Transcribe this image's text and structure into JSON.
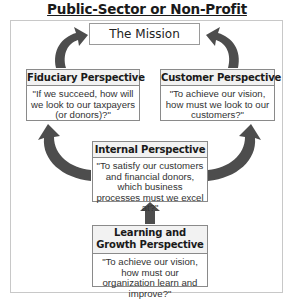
{
  "title": "Public-Sector or Non-Profit",
  "mission": {
    "label": "The Mission"
  },
  "boxes": {
    "fiduciary": {
      "header": "Fiduciary Perspective",
      "question": "\"If we succeed, how will we look to our taxpayers (or donors)?\""
    },
    "customer": {
      "header": "Customer Perspective",
      "question": "\"To achieve our vision, how must we look to our customers?\""
    },
    "internal": {
      "header": "Internal Perspective",
      "question": "\"To satisfy our customers and financial donors, which business processes must we excel at?\""
    },
    "learning": {
      "header": "Learning and Growth Perspective",
      "question": "\"To achieve our vision, how must our organization learn and improve?\""
    }
  },
  "arrows": [
    {
      "from": "fiduciary",
      "to": "mission"
    },
    {
      "from": "customer",
      "to": "mission"
    },
    {
      "from": "internal",
      "to": "fiduciary"
    },
    {
      "from": "internal",
      "to": "customer"
    },
    {
      "from": "learning",
      "to": "internal"
    }
  ],
  "colors": {
    "arrow": "#4d4d4d",
    "border": "#8a8a8a",
    "header_bg": "#f2f2f2"
  }
}
